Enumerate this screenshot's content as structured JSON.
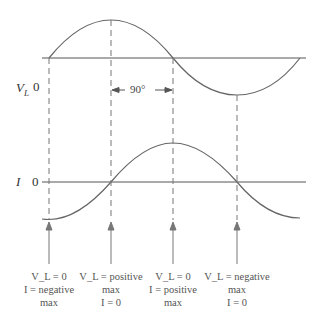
{
  "diagram": {
    "vl_axis_label": "V",
    "vl_axis_sub": "L",
    "vl_zero": "0",
    "i_axis_label": "I",
    "i_zero": "0",
    "phase_label": "90°",
    "colors": {
      "curve": "#666666",
      "axis": "#555555",
      "dash": "#777777",
      "text": "#555555"
    },
    "annotations": [
      {
        "line1": "V_L = 0",
        "line2": "I = negative",
        "line3": "max"
      },
      {
        "line1": "V_L = positive",
        "line2": "max",
        "line3": "I = 0"
      },
      {
        "line1": "V_L = 0",
        "line2": "I = positive",
        "line3": "max"
      },
      {
        "line1": "V_L = negative",
        "line2": "max",
        "line3": "I = 0"
      }
    ]
  }
}
